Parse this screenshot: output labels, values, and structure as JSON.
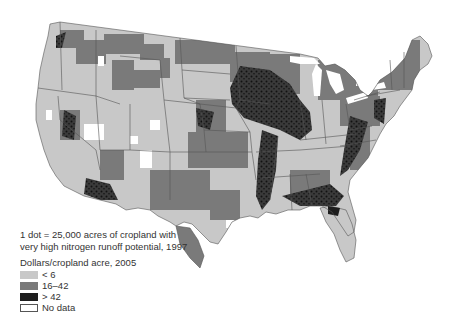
{
  "map": {
    "region": "Contiguous United States",
    "units": "county",
    "colors": {
      "low": "#c8c8c8",
      "mid": "#7a7a7a",
      "high": "#1e1e1e",
      "no_data": "#ffffff",
      "border": "#555555"
    }
  },
  "legend": {
    "dot_note_line1": "1 dot = 25,000 acres of cropland with",
    "dot_note_line2": "very high nitrogen runoff potential, 1997",
    "title": "Dollars/cropland acre, 2005",
    "items": [
      {
        "label": "< 6",
        "color": "#c8c8c8"
      },
      {
        "label": "16–42",
        "color": "#7a7a7a"
      },
      {
        "label": "> 42",
        "color": "#1e1e1e"
      },
      {
        "label": "No data",
        "color": "#ffffff"
      }
    ]
  }
}
